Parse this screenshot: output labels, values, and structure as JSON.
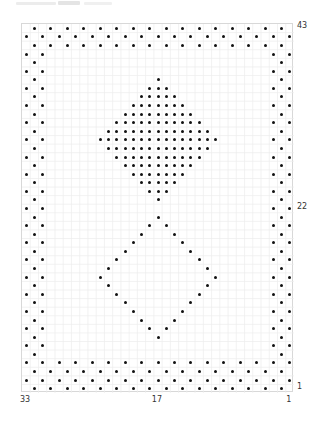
{
  "chart_data": {
    "type": "dot-grid-pattern",
    "grid": {
      "columns": 33,
      "rows": 43,
      "column_numbering": "right-to-left",
      "row_numbering": "bottom-to-top"
    },
    "axis_labels": {
      "bottom": [
        {
          "col": 33,
          "text": "33"
        },
        {
          "col": 17,
          "text": "17"
        },
        {
          "col": 1,
          "text": "1"
        }
      ],
      "right": [
        {
          "row": 43,
          "text": "43"
        },
        {
          "row": 22,
          "text": "22"
        },
        {
          "row": 1,
          "text": "1"
        }
      ]
    },
    "shapes": [
      {
        "name": "checkerboard-border",
        "rule": "(col+row) odd",
        "bottom_rows": 4,
        "top_rows": 3,
        "side_cols": 3
      },
      {
        "name": "filled-diamond",
        "center_col": 17,
        "center_row": 30,
        "radius": 7,
        "fill": true
      },
      {
        "name": "hollow-diamond",
        "center_col": 17,
        "center_row": 14,
        "radius": 7,
        "fill": false
      }
    ],
    "colors": {
      "dot": "#111111",
      "grid_line": "#ececec",
      "border": "#d8d8d8",
      "label": "#333333"
    }
  }
}
